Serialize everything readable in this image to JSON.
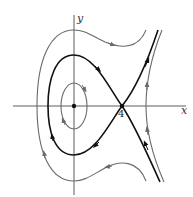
{
  "diagram": {
    "type": "phase-portrait",
    "axes": {
      "x_label": "x",
      "y_label": "y"
    },
    "points": [
      {
        "name": "center",
        "label": "",
        "kind": "center"
      },
      {
        "name": "saddle",
        "label": "4",
        "kind": "saddle"
      }
    ],
    "curves": [
      {
        "name": "inner-orbit",
        "style": "gray",
        "direction": "clockwise"
      },
      {
        "name": "separatrix-loop",
        "style": "black",
        "direction": "clockwise"
      },
      {
        "name": "separatrix-outgoing",
        "style": "black",
        "direction": "outward-upper-right"
      },
      {
        "name": "separatrix-incoming",
        "style": "black",
        "direction": "inward-from-lower-right"
      },
      {
        "name": "outer-orbit-left",
        "style": "gray",
        "direction": "clockwise"
      },
      {
        "name": "outer-orbit-right",
        "style": "gray",
        "direction": "upward"
      }
    ],
    "colors": {
      "separatrix": "#111111",
      "orbit": "#6a6a6a",
      "axis": "#333333"
    }
  }
}
